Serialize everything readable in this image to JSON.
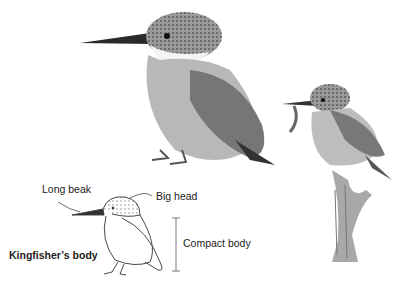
{
  "illustration": {
    "subjects": [
      "large-kingfisher-sketch",
      "perched-kingfisher-with-fish",
      "kingfisher-body-diagram"
    ],
    "labels": {
      "long_beak": "Long beak",
      "big_head": "Big head",
      "compact_body": "Compact body",
      "title": "Kingfisher’s body"
    }
  }
}
